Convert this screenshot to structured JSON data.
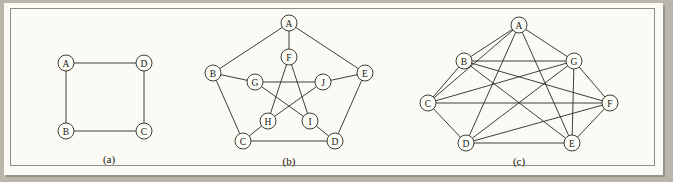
{
  "figure": {
    "background_color": "#fbfaf4",
    "border_color": "#8d8c86",
    "ink_color": "#2a2824",
    "panels": [
      {
        "id": "a",
        "caption": "(a)",
        "description": "four-cycle graph",
        "nodes": [
          {
            "label": "A",
            "x": 32,
            "y": 60
          },
          {
            "label": "D",
            "x": 110,
            "y": 60
          },
          {
            "label": "B",
            "x": 32,
            "y": 128
          },
          {
            "label": "C",
            "x": 110,
            "y": 128
          }
        ],
        "edges": [
          [
            "A",
            "D"
          ],
          [
            "A",
            "B"
          ],
          [
            "D",
            "C"
          ],
          [
            "B",
            "C"
          ]
        ],
        "node_radius": 8
      },
      {
        "id": "b",
        "caption": "(b)",
        "description": "Petersen graph",
        "nodes": [
          {
            "label": "A",
            "x": 100,
            "y": 20
          },
          {
            "label": "B",
            "x": 24,
            "y": 70
          },
          {
            "label": "E",
            "x": 176,
            "y": 70
          },
          {
            "label": "C",
            "x": 54,
            "y": 138
          },
          {
            "label": "D",
            "x": 146,
            "y": 138
          },
          {
            "label": "F",
            "x": 100,
            "y": 54
          },
          {
            "label": "G",
            "x": 66,
            "y": 79
          },
          {
            "label": "J",
            "x": 134,
            "y": 79
          },
          {
            "label": "H",
            "x": 79,
            "y": 118
          },
          {
            "label": "I",
            "x": 121,
            "y": 118
          }
        ],
        "edges": [
          [
            "A",
            "B"
          ],
          [
            "B",
            "C"
          ],
          [
            "C",
            "D"
          ],
          [
            "D",
            "E"
          ],
          [
            "E",
            "A"
          ],
          [
            "A",
            "F"
          ],
          [
            "B",
            "G"
          ],
          [
            "C",
            "H"
          ],
          [
            "D",
            "I"
          ],
          [
            "E",
            "J"
          ],
          [
            "F",
            "H"
          ],
          [
            "H",
            "J"
          ],
          [
            "J",
            "G"
          ],
          [
            "G",
            "I"
          ],
          [
            "I",
            "F"
          ]
        ],
        "node_radius": 8
      },
      {
        "id": "c",
        "caption": "(c)",
        "description": "four-regular circulant graph on seven vertices",
        "nodes": [
          {
            "label": "A",
            "x": 125,
            "y": 22
          },
          {
            "label": "B",
            "x": 70,
            "y": 58
          },
          {
            "label": "G",
            "x": 180,
            "y": 58
          },
          {
            "label": "C",
            "x": 34,
            "y": 100
          },
          {
            "label": "F",
            "x": 216,
            "y": 100
          },
          {
            "label": "D",
            "x": 72,
            "y": 140
          },
          {
            "label": "E",
            "x": 178,
            "y": 140
          }
        ],
        "edges": [
          [
            "A",
            "B"
          ],
          [
            "A",
            "G"
          ],
          [
            "B",
            "C"
          ],
          [
            "C",
            "D"
          ],
          [
            "D",
            "E"
          ],
          [
            "E",
            "F"
          ],
          [
            "F",
            "G"
          ],
          [
            "A",
            "C"
          ],
          [
            "A",
            "E"
          ],
          [
            "A",
            "D"
          ],
          [
            "B",
            "G"
          ],
          [
            "B",
            "E"
          ],
          [
            "B",
            "F"
          ],
          [
            "G",
            "C"
          ],
          [
            "G",
            "D"
          ],
          [
            "C",
            "F"
          ],
          [
            "D",
            "F"
          ],
          [
            "E",
            "G"
          ]
        ],
        "node_radius": 8
      }
    ]
  }
}
